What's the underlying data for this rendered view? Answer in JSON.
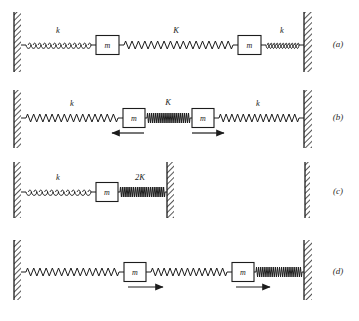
{
  "figure": {
    "title": "",
    "background_color": "#ffffff",
    "ink_color": "#1c1c1c",
    "width": 359,
    "height": 321,
    "panels": [
      {
        "id": "a",
        "label": "(a)",
        "label_x": 338,
        "label_y": 47,
        "baseline_y": 45,
        "walls": [
          {
            "name": "left-wall",
            "x": 14,
            "y": 12,
            "w": 7,
            "h": 60
          },
          {
            "name": "right-wall",
            "x": 304,
            "y": 12,
            "w": 8,
            "h": 60
          }
        ],
        "elements": [
          {
            "type": "spring",
            "name": "spring-k-left",
            "style": "coil",
            "x1": 21,
            "x2": 96,
            "coils": 13,
            "amp": 4.5,
            "label": "k",
            "label_x": 58,
            "label_y": 33
          },
          {
            "type": "mass",
            "name": "mass-left",
            "x": 96,
            "w": 23,
            "h": 19,
            "label": "m"
          },
          {
            "type": "spring",
            "name": "spring-K-middle",
            "style": "zigzag",
            "x1": 119,
            "x2": 238,
            "coils": 17,
            "amp": 4.0,
            "label": "K",
            "label_x": 176,
            "label_y": 33
          },
          {
            "type": "mass",
            "name": "mass-right",
            "x": 238,
            "w": 23,
            "h": 19,
            "label": "m"
          },
          {
            "type": "spring",
            "name": "spring-k-right",
            "style": "coil",
            "x1": 261,
            "x2": 304,
            "coils": 11,
            "amp": 4.5,
            "label": "k",
            "label_x": 282,
            "label_y": 33
          }
        ],
        "arrows": []
      },
      {
        "id": "b",
        "label": "(b)",
        "label_x": 338,
        "label_y": 120,
        "baseline_y": 118,
        "walls": [
          {
            "name": "left-wall",
            "x": 14,
            "y": 90,
            "w": 7,
            "h": 58
          },
          {
            "name": "right-wall",
            "x": 304,
            "y": 90,
            "w": 8,
            "h": 58
          }
        ],
        "elements": [
          {
            "type": "spring",
            "name": "spring-k-left",
            "style": "zigzag",
            "x1": 21,
            "x2": 123,
            "coils": 15,
            "amp": 4.0,
            "label": "k",
            "label_x": 72,
            "label_y": 106
          },
          {
            "type": "mass",
            "name": "mass-left",
            "x": 123,
            "w": 22,
            "h": 19,
            "label": "m"
          },
          {
            "type": "spring",
            "name": "spring-K-middle",
            "style": "compressed",
            "x1": 145,
            "x2": 192,
            "coils": 22,
            "amp": 5.0,
            "label": "K",
            "label_x": 168,
            "label_y": 105
          },
          {
            "type": "mass",
            "name": "mass-right",
            "x": 192,
            "w": 22,
            "h": 19,
            "label": "m"
          },
          {
            "type": "spring",
            "name": "spring-k-right",
            "style": "zigzag",
            "x1": 214,
            "x2": 304,
            "coils": 14,
            "amp": 4.0,
            "label": "k",
            "label_x": 258,
            "label_y": 106
          }
        ],
        "arrows": [
          {
            "name": "arrow-left-mass",
            "x1": 144,
            "x2": 112,
            "y": 133,
            "direction": "left"
          },
          {
            "name": "arrow-right-mass",
            "x1": 192,
            "x2": 224,
            "y": 133,
            "direction": "right"
          }
        ]
      },
      {
        "id": "c",
        "label": "(c)",
        "label_x": 338,
        "label_y": 194,
        "baseline_y": 192,
        "walls": [
          {
            "name": "left-wall",
            "x": 14,
            "y": 162,
            "w": 7,
            "h": 56
          },
          {
            "name": "middle-wall",
            "x": 167,
            "y": 162,
            "w": 7,
            "h": 56
          },
          {
            "name": "far-right-wall",
            "x": 305,
            "y": 162,
            "w": 5,
            "h": 56
          }
        ],
        "elements": [
          {
            "type": "spring",
            "name": "spring-k",
            "style": "coil",
            "x1": 21,
            "x2": 96,
            "coils": 12,
            "amp": 4.5,
            "label": "k",
            "label_x": 58,
            "label_y": 180
          },
          {
            "type": "mass",
            "name": "mass",
            "x": 96,
            "w": 22,
            "h": 19,
            "label": "m"
          },
          {
            "type": "spring",
            "name": "spring-2K",
            "style": "compressed",
            "x1": 118,
            "x2": 167,
            "coils": 24,
            "amp": 5.0,
            "label": "2K",
            "label_x": 140,
            "label_y": 180
          }
        ],
        "arrows": []
      },
      {
        "id": "d",
        "label": "(d)",
        "label_x": 338,
        "label_y": 274,
        "baseline_y": 272,
        "walls": [
          {
            "name": "left-wall",
            "x": 14,
            "y": 240,
            "w": 7,
            "h": 60
          },
          {
            "name": "right-wall",
            "x": 304,
            "y": 240,
            "w": 8,
            "h": 60
          }
        ],
        "elements": [
          {
            "type": "spring",
            "name": "spring-left",
            "style": "zigzag",
            "x1": 21,
            "x2": 124,
            "coils": 15,
            "amp": 4.0,
            "label": "",
            "label_x": 0,
            "label_y": 0
          },
          {
            "type": "mass",
            "name": "mass-left",
            "x": 124,
            "w": 22,
            "h": 19,
            "label": "m"
          },
          {
            "type": "spring",
            "name": "spring-middle",
            "style": "zigzag",
            "x1": 146,
            "x2": 232,
            "coils": 13,
            "amp": 4.0,
            "label": "",
            "label_x": 0,
            "label_y": 0
          },
          {
            "type": "mass",
            "name": "mass-right",
            "x": 232,
            "w": 22,
            "h": 19,
            "label": "m"
          },
          {
            "type": "spring",
            "name": "spring-right",
            "style": "compressed",
            "x1": 254,
            "x2": 304,
            "coils": 22,
            "amp": 5.0,
            "label": "",
            "label_x": 0,
            "label_y": 0
          }
        ],
        "arrows": [
          {
            "name": "arrow-left-mass",
            "x1": 128,
            "x2": 163,
            "y": 287,
            "direction": "right"
          },
          {
            "name": "arrow-right-mass",
            "x1": 236,
            "x2": 270,
            "y": 287,
            "direction": "right"
          }
        ]
      }
    ]
  }
}
